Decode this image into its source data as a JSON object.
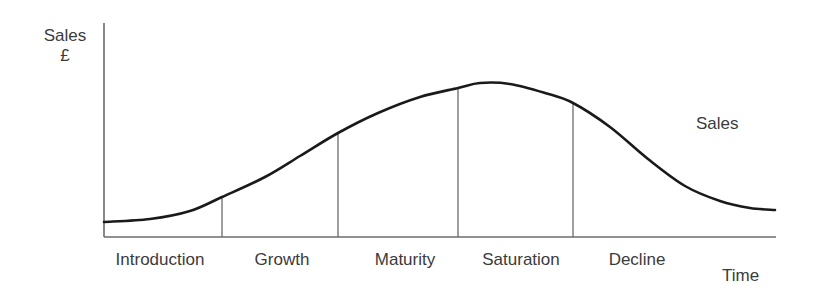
{
  "chart_data": {
    "type": "line",
    "title": "",
    "xlabel": "Time",
    "ylabel": "Sales",
    "ylabel_unit": "£",
    "grid": false,
    "legend_position": "inline-right",
    "series": [
      {
        "name": "Sales",
        "description": "Product life cycle sales curve: S-shaped rise through introduction and growth, plateau at maturity and saturation, then decline.",
        "points": [
          {
            "x": 104,
            "y": 222
          },
          {
            "x": 150,
            "y": 219
          },
          {
            "x": 190,
            "y": 211
          },
          {
            "x": 222,
            "y": 197
          },
          {
            "x": 265,
            "y": 177
          },
          {
            "x": 300,
            "y": 156
          },
          {
            "x": 338,
            "y": 133
          },
          {
            "x": 378,
            "y": 113
          },
          {
            "x": 420,
            "y": 97
          },
          {
            "x": 458,
            "y": 88
          },
          {
            "x": 480,
            "y": 83
          },
          {
            "x": 510,
            "y": 84
          },
          {
            "x": 545,
            "y": 93
          },
          {
            "x": 573,
            "y": 103
          },
          {
            "x": 610,
            "y": 127
          },
          {
            "x": 648,
            "y": 159
          },
          {
            "x": 685,
            "y": 186
          },
          {
            "x": 720,
            "y": 201
          },
          {
            "x": 750,
            "y": 208
          },
          {
            "x": 775,
            "y": 210
          }
        ]
      }
    ],
    "stages": [
      {
        "label": "Introduction",
        "start_x": 104,
        "end_x": 222,
        "label_center_x": 160
      },
      {
        "label": "Growth",
        "start_x": 222,
        "end_x": 338,
        "label_center_x": 282
      },
      {
        "label": "Maturity",
        "start_x": 338,
        "end_x": 458,
        "label_center_x": 405
      },
      {
        "label": "Saturation",
        "start_x": 458,
        "end_x": 573,
        "label_center_x": 521
      },
      {
        "label": "Decline",
        "start_x": 573,
        "end_x": 776,
        "label_center_x": 637
      }
    ],
    "dividers": [
      {
        "x": 222,
        "y_top": 197
      },
      {
        "x": 338,
        "y_top": 133
      },
      {
        "x": 458,
        "y_top": 88
      },
      {
        "x": 573,
        "y_top": 103
      }
    ],
    "axes": {
      "y_axis": {
        "x": 104,
        "y_top": 23,
        "y_bottom": 237
      },
      "x_axis": {
        "y": 237,
        "x_left": 104,
        "x_right": 776
      }
    },
    "colors": {
      "curve": "#1a1a1a",
      "axis": "#6b6b6b",
      "divider": "#6b6b6b",
      "text": "#3b3b3b",
      "background": "#ffffff"
    }
  }
}
